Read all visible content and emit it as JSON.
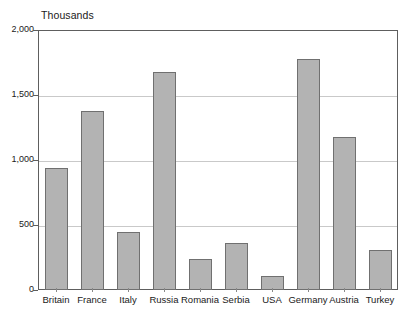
{
  "chart_data": {
    "type": "bar",
    "title": "",
    "subtitle": "",
    "unit_caption": "Thousands",
    "xlabel": "",
    "ylabel": "",
    "categories": [
      "Britain",
      "France",
      "Italy",
      "Russia",
      "Romania",
      "Serbia",
      "USA",
      "Germany",
      "Austria",
      "Turkey"
    ],
    "values": [
      940,
      1380,
      450,
      1680,
      240,
      360,
      110,
      1780,
      1180,
      310
    ],
    "series": [
      {
        "name": "",
        "values": [
          940,
          1380,
          450,
          1680,
          240,
          360,
          110,
          1780,
          1180,
          310
        ]
      }
    ],
    "ylim": [
      0,
      2000
    ],
    "ytick_values": [
      0,
      500,
      1000,
      1500,
      2000
    ],
    "ytick_labels": [
      "0",
      "500",
      "1,000",
      "1,500",
      "2,000"
    ],
    "grid": true,
    "legend": "none",
    "bar_fill_color": "#b3b3b3",
    "bar_border_color": "#707070",
    "gridline_color": "#c9c9c9",
    "axis_color": "#5e5e5e",
    "background_color": "#ffffff",
    "text_color": "#1a1a1a"
  }
}
